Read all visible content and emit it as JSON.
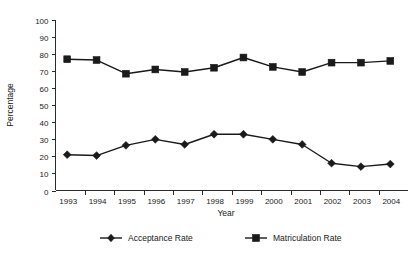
{
  "chart_data": {
    "type": "line",
    "title": "",
    "xlabel": "Year",
    "ylabel": "Percentage",
    "categories": [
      "1993",
      "1994",
      "1995",
      "1996",
      "1997",
      "1998",
      "1999",
      "2000",
      "2001",
      "2002",
      "2003",
      "2004"
    ],
    "series": [
      {
        "name": "Acceptance Rate",
        "marker": "diamond",
        "color": "#1a1a1a",
        "values": [
          21,
          20.5,
          26.5,
          30,
          27,
          33,
          33,
          30,
          27,
          16,
          14,
          15.5
        ]
      },
      {
        "name": "Matriculation Rate",
        "marker": "square",
        "color": "#1a1a1a",
        "values": [
          77,
          76.5,
          68.5,
          71,
          69.5,
          72,
          78,
          72.5,
          69.5,
          75,
          75,
          76
        ]
      }
    ],
    "ylim": [
      0,
      100
    ],
    "ytick_step": 10,
    "yticks": [
      "0",
      "10",
      "20",
      "30",
      "40",
      "50",
      "60",
      "70",
      "80",
      "90",
      "100"
    ],
    "grid": false,
    "legend_position": "bottom"
  }
}
